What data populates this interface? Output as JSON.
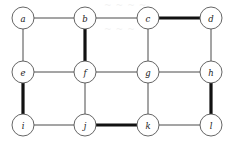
{
  "figure": {
    "name": "grid-graph-with-highlighted-edges",
    "width": 233,
    "height": 142,
    "background_color": "#ffffff"
  },
  "style": {
    "node_radius": 11,
    "node_fill": "#ffffff",
    "node_stroke": "#555555",
    "label_color": "#1a1a1a",
    "thin_edge_color": "#4a4a4a",
    "thin_edge_width": 1,
    "thick_edge_color": "#111111",
    "thick_edge_width": 3.2
  },
  "nodes": [
    {
      "id": "a",
      "label": "a",
      "x": 23,
      "y": 18,
      "row": 0,
      "col": 0
    },
    {
      "id": "b",
      "label": "b",
      "x": 85,
      "y": 18,
      "row": 0,
      "col": 1
    },
    {
      "id": "c",
      "label": "c",
      "x": 148,
      "y": 18,
      "row": 0,
      "col": 2
    },
    {
      "id": "d",
      "label": "d",
      "x": 211,
      "y": 18,
      "row": 0,
      "col": 3
    },
    {
      "id": "e",
      "label": "e",
      "x": 23,
      "y": 72,
      "row": 1,
      "col": 0
    },
    {
      "id": "f",
      "label": "f",
      "x": 85,
      "y": 72,
      "row": 1,
      "col": 1
    },
    {
      "id": "g",
      "label": "g",
      "x": 148,
      "y": 72,
      "row": 1,
      "col": 2
    },
    {
      "id": "h",
      "label": "h",
      "x": 211,
      "y": 72,
      "row": 1,
      "col": 3
    },
    {
      "id": "i",
      "label": "i",
      "x": 23,
      "y": 125,
      "row": 2,
      "col": 0
    },
    {
      "id": "j",
      "label": "j",
      "x": 85,
      "y": 125,
      "row": 2,
      "col": 1
    },
    {
      "id": "k",
      "label": "k",
      "x": 148,
      "y": 125,
      "row": 2,
      "col": 2
    },
    {
      "id": "l",
      "label": "l",
      "x": 211,
      "y": 125,
      "row": 2,
      "col": 3
    }
  ],
  "edges": [
    {
      "id": "a-b",
      "from": "a",
      "to": "b",
      "weight": "thin",
      "x1": 34,
      "y1": 18,
      "x2": 74,
      "y2": 18
    },
    {
      "id": "b-c",
      "from": "b",
      "to": "c",
      "weight": "thin",
      "x1": 96,
      "y1": 18,
      "x2": 137,
      "y2": 18
    },
    {
      "id": "c-d",
      "from": "c",
      "to": "d",
      "weight": "thick",
      "x1": 159,
      "y1": 18,
      "x2": 200,
      "y2": 18
    },
    {
      "id": "a-e",
      "from": "a",
      "to": "e",
      "weight": "thin",
      "x1": 23,
      "y1": 29,
      "x2": 23,
      "y2": 61
    },
    {
      "id": "b-f",
      "from": "b",
      "to": "f",
      "weight": "thick",
      "x1": 85,
      "y1": 29,
      "x2": 85,
      "y2": 61
    },
    {
      "id": "c-g",
      "from": "c",
      "to": "g",
      "weight": "thin",
      "x1": 148,
      "y1": 29,
      "x2": 148,
      "y2": 61
    },
    {
      "id": "d-h",
      "from": "d",
      "to": "h",
      "weight": "thin",
      "x1": 211,
      "y1": 29,
      "x2": 211,
      "y2": 61
    },
    {
      "id": "e-f",
      "from": "e",
      "to": "f",
      "weight": "thin",
      "x1": 34,
      "y1": 72,
      "x2": 74,
      "y2": 72
    },
    {
      "id": "f-g",
      "from": "f",
      "to": "g",
      "weight": "thin",
      "x1": 96,
      "y1": 72,
      "x2": 137,
      "y2": 72
    },
    {
      "id": "g-h",
      "from": "g",
      "to": "h",
      "weight": "thin",
      "x1": 159,
      "y1": 72,
      "x2": 200,
      "y2": 72
    },
    {
      "id": "e-i",
      "from": "e",
      "to": "i",
      "weight": "thick",
      "x1": 23,
      "y1": 83,
      "x2": 23,
      "y2": 114
    },
    {
      "id": "f-j",
      "from": "f",
      "to": "j",
      "weight": "thin",
      "x1": 85,
      "y1": 83,
      "x2": 85,
      "y2": 114
    },
    {
      "id": "g-k",
      "from": "g",
      "to": "k",
      "weight": "thin",
      "x1": 148,
      "y1": 83,
      "x2": 148,
      "y2": 114
    },
    {
      "id": "h-l",
      "from": "h",
      "to": "l",
      "weight": "thick",
      "x1": 211,
      "y1": 83,
      "x2": 211,
      "y2": 114
    },
    {
      "id": "i-j",
      "from": "i",
      "to": "j",
      "weight": "thin",
      "x1": 34,
      "y1": 125,
      "x2": 74,
      "y2": 125
    },
    {
      "id": "j-k",
      "from": "j",
      "to": "k",
      "weight": "thick",
      "x1": 96,
      "y1": 125,
      "x2": 137,
      "y2": 125
    },
    {
      "id": "k-l",
      "from": "k",
      "to": "l",
      "weight": "thin",
      "x1": 159,
      "y1": 125,
      "x2": 200,
      "y2": 125
    }
  ]
}
